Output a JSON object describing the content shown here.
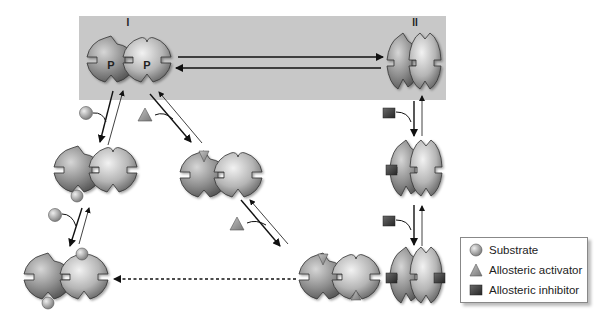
{
  "diagram": {
    "type": "allosteric-enzyme-regulation",
    "states": {
      "state_I": {
        "label": "I",
        "subunit_marks": [
          "P",
          "P"
        ]
      },
      "state_II": {
        "label": "II"
      }
    },
    "legend": {
      "items": [
        {
          "icon": "substrate-circle-icon",
          "label": "Substrate"
        },
        {
          "icon": "activator-triangle-icon",
          "label": "Allosteric activator"
        },
        {
          "icon": "inhibitor-square-icon",
          "label": "Allosteric inhibitor"
        }
      ]
    },
    "colors": {
      "shaded_box": "#c8c8c8",
      "enzyme_light": "#e6e6e6",
      "enzyme_dark": "#6f6f6f",
      "ligand": "#9a9a9a",
      "inhibitor": "#3e3e3e",
      "arrow": "#111111"
    }
  }
}
